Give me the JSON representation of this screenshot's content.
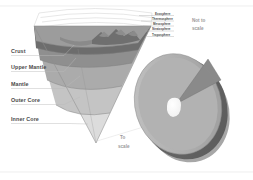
{
  "figure": {
    "background_color": "#ffffff"
  },
  "interior_labels": [
    {
      "id": "crust",
      "label": "Crust",
      "color": "#6d6d6d"
    },
    {
      "id": "upper-mantle",
      "label": "Upper Mantle",
      "color": "#8a8a8a"
    },
    {
      "id": "mantle",
      "label": "Mantle",
      "color": "#a6a6a6"
    },
    {
      "id": "outer-core",
      "label": "Outer Core",
      "color": "#c2c2c2"
    },
    {
      "id": "inner-core",
      "label": "Inner Core",
      "color": "#dedede"
    }
  ],
  "atmosphere_labels": [
    {
      "id": "exosphere",
      "label": "Exosphere"
    },
    {
      "id": "thermosphere",
      "label": "Thermosphere"
    },
    {
      "id": "mesosphere",
      "label": "Mesosphere"
    },
    {
      "id": "stratosphere",
      "label": "Stratosphere"
    },
    {
      "id": "troposphere",
      "label": "Troposphere"
    }
  ],
  "notes": {
    "not_to_scale_line1": "Not to",
    "not_to_scale_line2": "scale",
    "to_scale_line1": "To",
    "to_scale_line2": "scale"
  },
  "palette": {
    "crust": "#6d6d6d",
    "crust_top": "#7c7c7c",
    "upper_mantle": "#8f8f8f",
    "mantle": "#ababab",
    "outer_core": "#c4c4c4",
    "inner_core": "#dcdcdc",
    "sphere_face": "#b4b4b4",
    "sphere_cut": "#8c8c8c",
    "sphere_rim": "#6a6a6a",
    "sphere_core": "#fbfbfb",
    "label_text": "#4a4a4a",
    "note_text": "#9a9a9a",
    "leader_line": "#b9b9b9"
  }
}
